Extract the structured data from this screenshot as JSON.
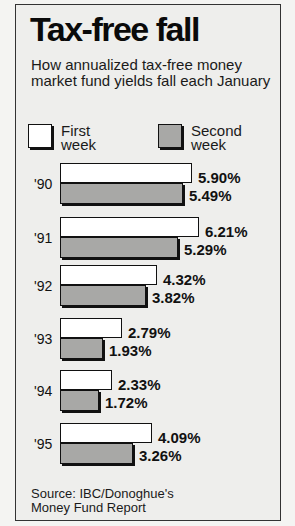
{
  "title": "Tax-free fall",
  "subtitle": "How annualized tax-free money market fund yields fall each January",
  "legend": [
    {
      "label_line1": "First",
      "label_line2": "week",
      "color": "#ffffff"
    },
    {
      "label_line1": "Second",
      "label_line2": "week",
      "color": "#a8a8a6"
    }
  ],
  "rows": [
    {
      "year": "'90",
      "first": "5.90%",
      "second": "5.49%"
    },
    {
      "year": "'91",
      "first": "6.21%",
      "second": "5.29%"
    },
    {
      "year": "'92",
      "first": "4.32%",
      "second": "3.82%"
    },
    {
      "year": "'93",
      "first": "2.79%",
      "second": "1.93%"
    },
    {
      "year": "'94",
      "first": "2.33%",
      "second": "1.72%"
    },
    {
      "year": "'95",
      "first": "4.09%",
      "second": "3.26%"
    }
  ],
  "source_line1": "Source: IBC/Donoghue's",
  "source_line2": "Money Fund Report",
  "chart_data": {
    "type": "bar",
    "orientation": "horizontal",
    "title": "Tax-free fall",
    "subtitle": "How annualized tax-free money market fund yields fall each January",
    "categories": [
      "'90",
      "'91",
      "'92",
      "'93",
      "'94",
      "'95"
    ],
    "series": [
      {
        "name": "First week",
        "values": [
          5.9,
          6.21,
          4.32,
          2.79,
          2.33,
          4.09
        ],
        "color": "#ffffff"
      },
      {
        "name": "Second week",
        "values": [
          5.49,
          5.29,
          3.82,
          1.93,
          1.72,
          3.26
        ],
        "color": "#a8a8a6"
      }
    ],
    "value_format": "%",
    "xlabel": "",
    "ylabel": "",
    "grid": false,
    "legend_position": "top",
    "source": "Source: IBC/Donoghue's Money Fund Report"
  }
}
